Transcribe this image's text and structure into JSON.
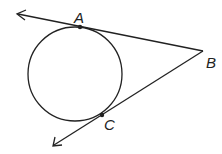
{
  "diagram": {
    "type": "geometry",
    "colors": {
      "stroke": "#222222",
      "background": "#ffffff"
    },
    "circle": {
      "cx": 75,
      "cy": 74,
      "r": 47
    },
    "points": [
      {
        "name": "A",
        "label": "A",
        "x": 80,
        "y": 27,
        "label_x": 74,
        "label_y": 23
      },
      {
        "name": "B",
        "label": "B",
        "x": 203,
        "y": 51,
        "label_x": 206,
        "label_y": 68
      },
      {
        "name": "C",
        "label": "C",
        "x": 102,
        "y": 115,
        "label_x": 104,
        "label_y": 130
      }
    ],
    "rays": [
      {
        "from": "B",
        "through": "A",
        "end_x": 17,
        "end_y": 14
      },
      {
        "from": "B",
        "through": "C",
        "end_x": 53,
        "end_y": 146
      }
    ]
  }
}
